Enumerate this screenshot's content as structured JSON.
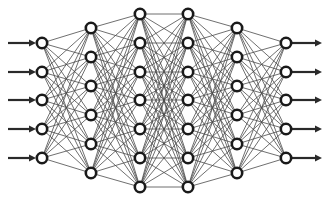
{
  "diagram": {
    "title": "",
    "type": "fully-connected neural network",
    "colors": {
      "background": "#ffffff",
      "node_stroke": "#1a1a1a",
      "node_fill": "#ffffff",
      "edge": "#4a4a4a",
      "arrow": "#2a2a2a"
    },
    "node_radius": 5.2,
    "layers": [
      {
        "name": "input-layer",
        "x": 42,
        "ys": [
          43,
          72,
          100,
          129,
          158
        ]
      },
      {
        "name": "hidden-layer-1",
        "x": 91,
        "ys": [
          28,
          57,
          86,
          115,
          144,
          173
        ]
      },
      {
        "name": "hidden-layer-2",
        "x": 140,
        "ys": [
          14,
          43,
          72,
          100,
          129,
          158,
          187
        ]
      },
      {
        "name": "hidden-layer-3",
        "x": 188,
        "ys": [
          14,
          43,
          72,
          100,
          129,
          158,
          187
        ]
      },
      {
        "name": "hidden-layer-4",
        "x": 237,
        "ys": [
          28,
          57,
          86,
          115,
          144,
          173
        ]
      },
      {
        "name": "output-layer",
        "x": 286,
        "ys": [
          43,
          72,
          100,
          129,
          158
        ]
      }
    ],
    "layer_sizes": [
      5,
      6,
      7,
      7,
      6,
      5
    ],
    "input_arrows": {
      "x1": 8,
      "x2": 36,
      "ys": [
        43,
        72,
        100,
        129,
        158
      ]
    },
    "output_arrows": {
      "x1": 292,
      "x2": 322,
      "ys": [
        43,
        72,
        100,
        129,
        158
      ]
    }
  }
}
